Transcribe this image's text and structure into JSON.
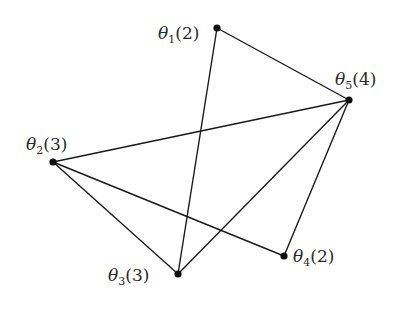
{
  "diagram": {
    "type": "graph",
    "nodes": [
      {
        "id": "theta1",
        "symbol": "θ",
        "subscript": "1",
        "weight": "(2)",
        "x": 217,
        "y": 28,
        "label_x": 158,
        "label_y": 39
      },
      {
        "id": "theta2",
        "symbol": "θ",
        "subscript": "2",
        "weight": "(3)",
        "x": 53,
        "y": 162,
        "label_x": 26,
        "label_y": 150
      },
      {
        "id": "theta3",
        "symbol": "θ",
        "subscript": "3",
        "weight": "(3)",
        "x": 178,
        "y": 274,
        "label_x": 108,
        "label_y": 281
      },
      {
        "id": "theta4",
        "symbol": "θ",
        "subscript": "4",
        "weight": "(2)",
        "x": 284,
        "y": 256,
        "label_x": 293,
        "label_y": 262
      },
      {
        "id": "theta5",
        "symbol": "θ",
        "subscript": "5",
        "weight": "(4)",
        "x": 349,
        "y": 100,
        "label_x": 335,
        "label_y": 85
      }
    ],
    "edges": [
      {
        "from": "theta1",
        "to": "theta5"
      },
      {
        "from": "theta1",
        "to": "theta3"
      },
      {
        "from": "theta5",
        "to": "theta2"
      },
      {
        "from": "theta5",
        "to": "theta3"
      },
      {
        "from": "theta5",
        "to": "theta4"
      },
      {
        "from": "theta2",
        "to": "theta3"
      },
      {
        "from": "theta2",
        "to": "theta4"
      }
    ],
    "colors": {
      "edge": "#1a1a1a",
      "node": "#111111",
      "label": "#2a2a2a",
      "background": "#ffffff"
    }
  }
}
